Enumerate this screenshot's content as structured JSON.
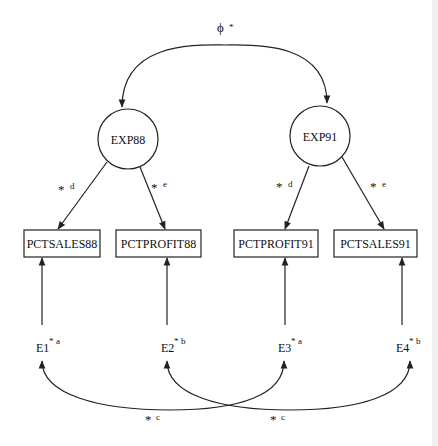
{
  "diagram": {
    "type": "structural-equation-path-diagram",
    "covariance_label": {
      "symbol": "ϕ",
      "star": "*"
    },
    "latent_factors": [
      {
        "id": "EXP88",
        "label": "EXP88"
      },
      {
        "id": "EXP91",
        "label": "EXP91"
      }
    ],
    "indicators": [
      {
        "id": "PCTSALES88",
        "label": "PCTSALES88"
      },
      {
        "id": "PCTPROFIT88",
        "label": "PCTPROFIT88"
      },
      {
        "id": "PCTPROFIT91",
        "label": "PCTPROFIT91"
      },
      {
        "id": "PCTSALES91",
        "label": "PCTSALES91"
      }
    ],
    "loadings": [
      {
        "from": "EXP88",
        "to": "PCTSALES88",
        "star": "*",
        "constraint": "d"
      },
      {
        "from": "EXP88",
        "to": "PCTPROFIT88",
        "star": "*",
        "constraint": "e"
      },
      {
        "from": "EXP91",
        "to": "PCTPROFIT91",
        "star": "*",
        "constraint": "d"
      },
      {
        "from": "EXP91",
        "to": "PCTSALES91",
        "star": "*",
        "constraint": "e"
      }
    ],
    "errors": [
      {
        "id": "E1",
        "label": "E1",
        "star": "*",
        "constraint": "a"
      },
      {
        "id": "E2",
        "label": "E2",
        "star": "*",
        "constraint": "b"
      },
      {
        "id": "E3",
        "label": "E3",
        "star": "*",
        "constraint": "a"
      },
      {
        "id": "E4",
        "label": "E4",
        "star": "*",
        "constraint": "b"
      }
    ],
    "error_covariances": [
      {
        "between": [
          "E1",
          "E3"
        ],
        "star": "*",
        "constraint": "c"
      },
      {
        "between": [
          "E2",
          "E4"
        ],
        "star": "*",
        "constraint": "c"
      }
    ]
  }
}
